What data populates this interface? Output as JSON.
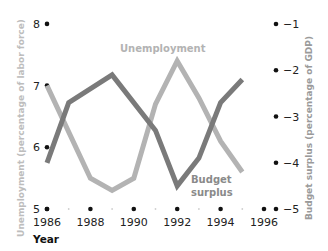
{
  "chart_data": {
    "type": "line",
    "title": "",
    "xlabel": "Year",
    "ylabel": "Unemployment (percentage of labor force)",
    "y2label": "Budget surplus (percentage of GDP)",
    "x_ticks": [
      "1986",
      "1988",
      "1990",
      "1992",
      "1994",
      "1996"
    ],
    "y_ticks": [
      "5",
      "6",
      "7",
      "8"
    ],
    "y2_ticks": [
      "−1",
      "−2",
      "−3",
      "−4",
      "−5"
    ],
    "ylim": [
      5,
      8
    ],
    "y2lim": [
      -5,
      -1
    ],
    "xlim": [
      1986,
      1997
    ],
    "grid": false,
    "series": [
      {
        "name": "Unemployment",
        "axis": "left",
        "color": "#b3b3b3",
        "x": [
          1986,
          1988,
          1989,
          1990,
          1991,
          1992,
          1993,
          1994,
          1995
        ],
        "values": [
          7.0,
          5.5,
          5.3,
          5.5,
          6.7,
          7.4,
          6.8,
          6.1,
          5.6
        ]
      },
      {
        "name": "Budget surplus",
        "axis": "right",
        "color": "#7a7a7a",
        "x": [
          1986,
          1987,
          1989,
          1991,
          1992,
          1993,
          1994,
          1995
        ],
        "values": [
          -4.0,
          -2.7,
          -2.1,
          -3.3,
          -4.5,
          -3.9,
          -2.7,
          -2.2
        ]
      }
    ],
    "annotations": [
      {
        "text": "Unemployment",
        "near": "1992 peak"
      },
      {
        "text": "Budget surplus",
        "near": "1993 trough"
      }
    ]
  },
  "labels": {
    "unemployment": "Unemployment",
    "budget_line1": "Budget",
    "budget_line2": "surplus",
    "year": "Year",
    "left_axis_title": "Unemployment (percentage of labor force)",
    "right_axis_title": "Budget surplus (percentage of GDP)"
  }
}
